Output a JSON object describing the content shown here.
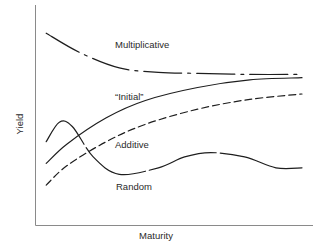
{
  "chart_data": {
    "type": "line",
    "title": "",
    "xlabel": "Maturity",
    "ylabel": "Yield",
    "grid": false,
    "legend": "inline labels",
    "x_ticks": [],
    "y_ticks": [],
    "note": "Conceptual diagram, no numeric scales; coordinates are normalized (x: 0=short maturity, 1=long; y: 0=low yield, 1=high yield).",
    "series": [
      {
        "name": "Multiplicative",
        "style": "dash-dot",
        "points": [
          [
            0.02,
            0.87
          ],
          [
            0.15,
            0.78
          ],
          [
            0.3,
            0.71
          ],
          [
            0.45,
            0.69
          ],
          [
            0.6,
            0.685
          ],
          [
            0.8,
            0.68
          ],
          [
            1.0,
            0.68
          ]
        ]
      },
      {
        "name": "\"Initial\"",
        "style": "solid",
        "points": [
          [
            0.02,
            0.27
          ],
          [
            0.1,
            0.36
          ],
          [
            0.25,
            0.48
          ],
          [
            0.4,
            0.56
          ],
          [
            0.6,
            0.62
          ],
          [
            0.8,
            0.655
          ],
          [
            1.0,
            0.665
          ]
        ]
      },
      {
        "name": "Additive",
        "style": "dashed",
        "points": [
          [
            0.02,
            0.17
          ],
          [
            0.1,
            0.26
          ],
          [
            0.25,
            0.37
          ],
          [
            0.4,
            0.45
          ],
          [
            0.6,
            0.52
          ],
          [
            0.8,
            0.565
          ],
          [
            1.0,
            0.59
          ]
        ]
      },
      {
        "name": "Random",
        "style": "solid-broken",
        "points": [
          [
            0.02,
            0.37
          ],
          [
            0.07,
            0.46
          ],
          [
            0.12,
            0.44
          ],
          [
            0.2,
            0.3
          ],
          [
            0.3,
            0.22
          ],
          [
            0.45,
            0.25
          ],
          [
            0.55,
            0.3
          ],
          [
            0.65,
            0.32
          ],
          [
            0.78,
            0.3
          ],
          [
            0.9,
            0.25
          ],
          [
            1.0,
            0.25
          ]
        ]
      }
    ]
  },
  "labels": {
    "multiplicative": "Multiplicative",
    "initial": "“Initial”",
    "additive": "Additive",
    "random": "Random",
    "x_axis": "Maturity",
    "y_axis": "Yield"
  }
}
